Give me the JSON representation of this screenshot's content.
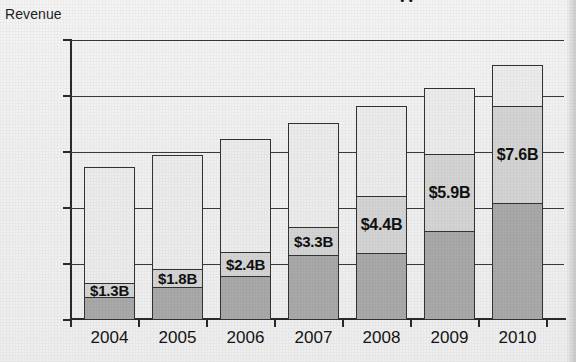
{
  "title_fragment": "yy",
  "axis_title": "Revenue",
  "chart_data": {
    "type": "bar",
    "title": "",
    "xlabel": "",
    "ylabel": "Revenue",
    "ylim": [
      0,
      10
    ],
    "grid": true,
    "legend": "none",
    "categories": [
      "2004",
      "2005",
      "2006",
      "2007",
      "2008",
      "2009",
      "2010"
    ],
    "ytick_labels": [
      "$10B",
      "8",
      "6",
      "4",
      "2",
      "0"
    ],
    "ytick_values": [
      10,
      8,
      6,
      4,
      2,
      0
    ],
    "series": [
      {
        "name": "Total revenue",
        "values": [
          5.45,
          5.9,
          6.45,
          7.05,
          7.65,
          8.3,
          9.1
        ]
      },
      {
        "name": "Highlighted revenue",
        "values": [
          1.3,
          1.8,
          2.4,
          3.3,
          4.4,
          5.9,
          7.6
        ]
      },
      {
        "name": "Lower segment",
        "values": [
          0.8,
          1.15,
          1.55,
          2.3,
          2.35,
          3.15,
          4.15
        ]
      }
    ],
    "data_labels": [
      "$1.3B",
      "$1.8B",
      "$2.4B",
      "$3.3B",
      "$4.4B",
      "$5.9B",
      "$7.6B"
    ]
  },
  "colors": {
    "bar_top_fill": "#ececec",
    "bar_label_fill": "#d4d4d4",
    "bar_lower_fill": "#a9a9a9",
    "outline": "#333333",
    "axis": "#2a2a2a",
    "page_background": "#f1f1f1"
  }
}
